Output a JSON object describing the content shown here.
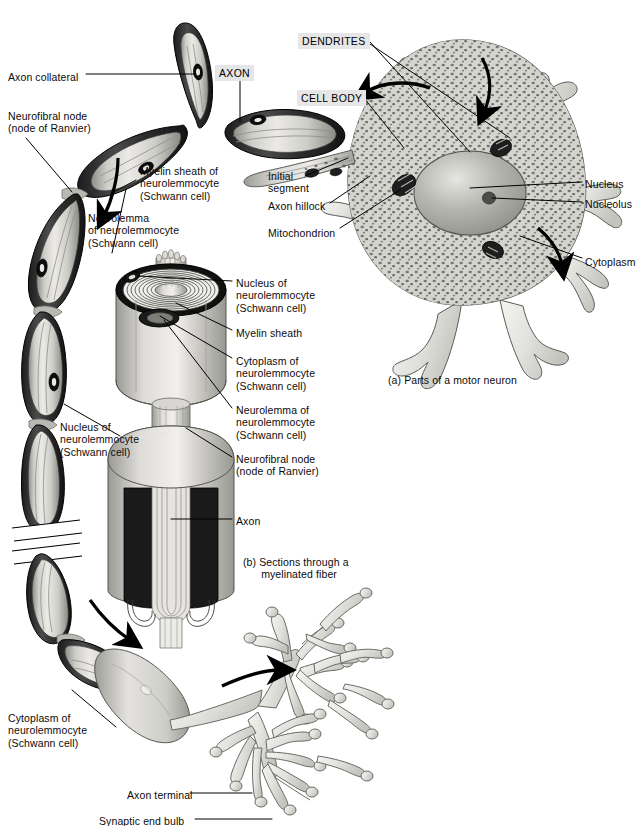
{
  "figure": {
    "captions": [
      {
        "id": "a",
        "text": "(a) Parts of a motor neuron",
        "x": 388,
        "y": 374
      },
      {
        "id": "b",
        "text": "(b) Sections through a\n      myelinated fiber",
        "x": 243,
        "y": 556
      }
    ],
    "boxed_labels": [
      {
        "name": "dendrites",
        "text": "DENDRITES",
        "x": 298,
        "y": 33
      },
      {
        "name": "axon",
        "text": "AXON",
        "x": 215,
        "y": 65
      },
      {
        "name": "cell-body",
        "text": "CELL BODY",
        "x": 297,
        "y": 90
      }
    ],
    "labels": [
      {
        "name": "axon-collateral",
        "text": "Axon collateral",
        "x": 8,
        "y": 71,
        "align": "left"
      },
      {
        "name": "neurofibral-node-upper",
        "text": "Neurofibral node\n(node of Ranvier)",
        "x": 8,
        "y": 110,
        "align": "left"
      },
      {
        "name": "myelin-sheath-of-neurolemmocyte",
        "text": "Myelin sheath of\nneurolemmocyte\n(Schwann cell)",
        "x": 140,
        "y": 165,
        "align": "left"
      },
      {
        "name": "neurolemma-of-neurolemmocyte",
        "text": "Neurolemma\nof neurolemmocyte\n(Schwann cell)",
        "x": 88,
        "y": 212,
        "align": "left"
      },
      {
        "name": "initial-segment",
        "text": "Initial\nsegment",
        "x": 268,
        "y": 170,
        "align": "left"
      },
      {
        "name": "axon-hillock",
        "text": "Axon hillock",
        "x": 268,
        "y": 200,
        "align": "left"
      },
      {
        "name": "mitochondrion",
        "text": "Mitochondrion",
        "x": 268,
        "y": 227,
        "align": "left"
      },
      {
        "name": "nucleus",
        "text": "Nucleus",
        "x": 585,
        "y": 178,
        "align": "left"
      },
      {
        "name": "nucleolus",
        "text": "Nucleolus",
        "x": 585,
        "y": 198,
        "align": "left"
      },
      {
        "name": "cytoplasm",
        "text": "Cytoplasm",
        "x": 585,
        "y": 256,
        "align": "left"
      },
      {
        "name": "nucleus-of-neurolemmocyte-section",
        "text": "Nucleus of\nneurolemmocyte\n(Schwann cell)",
        "x": 236,
        "y": 277,
        "align": "left"
      },
      {
        "name": "myelin-sheath-section",
        "text": "Myelin sheath",
        "x": 236,
        "y": 327,
        "align": "left"
      },
      {
        "name": "cytoplasm-of-neurolemmocyte-section",
        "text": "Cytoplasm of\nneurolemmocyte\n(Schwann cell)",
        "x": 236,
        "y": 355,
        "align": "left"
      },
      {
        "name": "neurolemma-of-neurolemmocyte-section",
        "text": "Neurolemma of\nneurolemmocyte\n(Schwann cell)",
        "x": 236,
        "y": 404,
        "align": "left"
      },
      {
        "name": "neurofibral-node-section",
        "text": "Neurofibral node\n(node of Ranvier)",
        "x": 236,
        "y": 453,
        "align": "left"
      },
      {
        "name": "axon-section",
        "text": "Axon",
        "x": 236,
        "y": 515,
        "align": "left"
      },
      {
        "name": "nucleus-of-neurolemmocyte-chain",
        "text": "Nucleus of\nneurolemmocyte\n(Schwann cell)",
        "x": 60,
        "y": 421,
        "align": "left"
      },
      {
        "name": "cytoplasm-of-neurolemmocyte-terminal",
        "text": "Cytoplasm of\nneurolemmocyte\n(Schwann cell)",
        "x": 8,
        "y": 712,
        "align": "left"
      },
      {
        "name": "axon-terminal",
        "text": "Axon terminal",
        "x": 127,
        "y": 789,
        "align": "left"
      },
      {
        "name": "synaptic-end-bulb",
        "text": "Synaptic end bulb",
        "x": 99,
        "y": 815,
        "align": "left"
      }
    ],
    "colors": {
      "ink": "#0b0b0b",
      "box_fill": "#e6e6e6",
      "myelin_dark": "#2b2b2b",
      "myelin_mid": "#6d6d6d",
      "sheath_light": "#d8d8d4",
      "axoplasm": "#c9c9c4",
      "cell_body_fill": "#d7d7d2",
      "cytoplasm_stipple": "#6a6a68",
      "nucleus_fill": "#a9a9a4",
      "dendrite_fill": "#e2e2de",
      "background": "#ffffff"
    }
  }
}
